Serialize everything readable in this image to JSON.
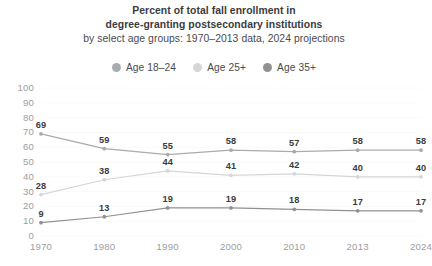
{
  "title": {
    "line1": "Percent of total fall enrollment in",
    "line2": "degree-granting postsecondary institutions",
    "subtitle": "by select age groups: 1970–2013 data, 2024 projections"
  },
  "legend": {
    "position": "top",
    "items": [
      {
        "label": "Age 18–24",
        "color": "#a9abad",
        "marker": "legend-dot-icon"
      },
      {
        "label": "Age 25+",
        "color": "#d5d6d7",
        "marker": "legend-dot-icon"
      },
      {
        "label": "Age 35+",
        "color": "#8f9193",
        "marker": "legend-dot-icon"
      }
    ]
  },
  "axes": {
    "ylabel": "Percent",
    "yticks": [
      "100",
      "90",
      "80",
      "70",
      "60",
      "50",
      "40",
      "30",
      "20",
      "10",
      "0"
    ],
    "xticks": [
      "1970",
      "1980",
      "1990",
      "2000",
      "2010",
      "2013",
      "2024"
    ]
  },
  "chart_data": {
    "type": "line",
    "title": "Percent of total fall enrollment in degree-granting postsecondary institutions",
    "subtitle": "by select age groups: 1970–2013 data, 2024 projections",
    "xlabel": "",
    "ylabel": "Percent",
    "categories": [
      "1970",
      "1980",
      "1990",
      "2000",
      "2010",
      "2013",
      "2024"
    ],
    "ylim": [
      0,
      100
    ],
    "ytick_step": 10,
    "grid": true,
    "legend_position": "top",
    "series": [
      {
        "name": "Age 18–24",
        "color": "#a9abad",
        "values": [
          69,
          59,
          55,
          58,
          57,
          58,
          58
        ]
      },
      {
        "name": "Age 25+",
        "color": "#d5d6d7",
        "values": [
          28,
          38,
          44,
          41,
          42,
          40,
          40
        ]
      },
      {
        "name": "Age 35+",
        "color": "#8f9193",
        "values": [
          9,
          13,
          19,
          19,
          18,
          17,
          17
        ]
      }
    ]
  }
}
